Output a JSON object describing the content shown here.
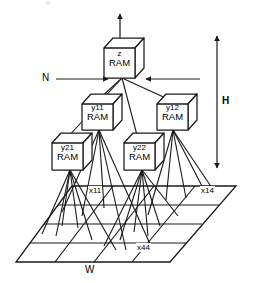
{
  "diagram": {
    "title_artifact": "o",
    "nodes": {
      "output": {
        "top": "z",
        "bottom": "RAM"
      },
      "mid_left": {
        "top": "y11",
        "bottom": "RAM"
      },
      "mid_right": {
        "top": "y12",
        "bottom": "RAM"
      },
      "low_left": {
        "top": "y21",
        "bottom": "RAM"
      },
      "low_right": {
        "top": "y22",
        "bottom": "RAM"
      }
    },
    "annotations": {
      "n_label": "N",
      "h_label": "H",
      "w_label": "W",
      "retina_first": "x11",
      "retina_top_right": "x14",
      "retina_last": "x44"
    },
    "colors": {
      "stroke": "#1a1a1a",
      "background": "#ffffff",
      "artifact": "#c9c9c9"
    },
    "grid": {
      "rows": 4,
      "cols": 4
    }
  }
}
